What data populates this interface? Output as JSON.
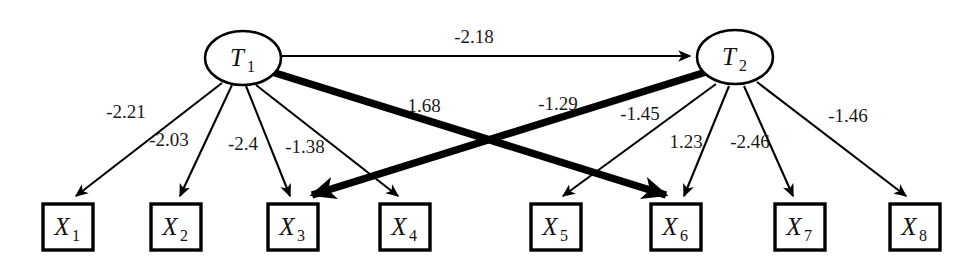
{
  "diagram": {
    "type": "path-diagram",
    "title": "",
    "latent_nodes": [
      {
        "id": "T1",
        "label": "T",
        "subscript": "1",
        "cx": 243,
        "cy": 58,
        "rx": 38,
        "ry": 27
      },
      {
        "id": "T2",
        "label": "T",
        "subscript": "2",
        "cx": 735,
        "cy": 57,
        "rx": 38,
        "ry": 27
      }
    ],
    "observed_nodes": [
      {
        "id": "X1",
        "label": "X",
        "subscript": "1",
        "x": 43,
        "y": 204,
        "w": 50,
        "h": 46
      },
      {
        "id": "X2",
        "label": "X",
        "subscript": "2",
        "x": 151,
        "y": 204,
        "w": 50,
        "h": 46
      },
      {
        "id": "X3",
        "label": "X",
        "subscript": "3",
        "x": 268,
        "y": 204,
        "w": 50,
        "h": 46
      },
      {
        "id": "X4",
        "label": "X",
        "subscript": "4",
        "x": 380,
        "y": 204,
        "w": 50,
        "h": 46
      },
      {
        "id": "X5",
        "label": "X",
        "subscript": "5",
        "x": 531,
        "y": 204,
        "w": 50,
        "h": 46
      },
      {
        "id": "X6",
        "label": "X",
        "subscript": "6",
        "x": 651,
        "y": 204,
        "w": 50,
        "h": 46
      },
      {
        "id": "X7",
        "label": "X",
        "subscript": "7",
        "x": 775,
        "y": 204,
        "w": 50,
        "h": 46
      },
      {
        "id": "X8",
        "label": "X",
        "subscript": "8",
        "x": 890,
        "y": 204,
        "w": 50,
        "h": 46
      }
    ],
    "edges": [
      {
        "id": "e-t1-t2",
        "from": "T1",
        "to": "T2",
        "weight": "-2.18",
        "weight_value": -2.18,
        "style": "thin",
        "label_x": 474,
        "label_y": 43,
        "x1": 282,
        "y1": 56,
        "x2": 690,
        "y2": 56
      },
      {
        "id": "e-t1-x1",
        "from": "T1",
        "to": "X1",
        "weight": "-2.21",
        "weight_value": -2.21,
        "style": "thin",
        "label_x": 126,
        "label_y": 118,
        "x1": 222,
        "y1": 83,
        "x2": 76,
        "y2": 196
      },
      {
        "id": "e-t1-x2",
        "from": "T1",
        "to": "X2",
        "weight": "-2.03",
        "weight_value": -2.03,
        "style": "thin",
        "label_x": 169,
        "label_y": 146,
        "x1": 232,
        "y1": 85,
        "x2": 180,
        "y2": 196
      },
      {
        "id": "e-t1-x3",
        "from": "T1",
        "to": "X3",
        "weight": "-2.4",
        "weight_value": -2.4,
        "style": "thin",
        "label_x": 243,
        "label_y": 150,
        "x1": 246,
        "y1": 86,
        "x2": 290,
        "y2": 196
      },
      {
        "id": "e-t1-x4",
        "from": "T1",
        "to": "X4",
        "weight": "-1.38",
        "weight_value": -1.38,
        "style": "thin",
        "label_x": 305,
        "label_y": 153,
        "x1": 256,
        "y1": 85,
        "x2": 398,
        "y2": 196
      },
      {
        "id": "e-t1-x6",
        "from": "T1",
        "to": "X6",
        "weight": "1.68",
        "weight_value": 1.68,
        "style": "thick",
        "label_x": 424,
        "label_y": 112,
        "x1": 272,
        "y1": 72,
        "x2": 666,
        "y2": 195
      },
      {
        "id": "e-t2-x3",
        "from": "T2",
        "to": "X3",
        "weight": "-1.29",
        "weight_value": -1.29,
        "style": "thick",
        "label_x": 558,
        "label_y": 110,
        "x1": 706,
        "y1": 72,
        "x2": 312,
        "y2": 195
      },
      {
        "id": "e-t2-x5",
        "from": "T2",
        "to": "X5",
        "weight": "-1.45",
        "weight_value": -1.45,
        "style": "thin",
        "label_x": 640,
        "label_y": 120,
        "x1": 716,
        "y1": 84,
        "x2": 563,
        "y2": 196
      },
      {
        "id": "e-t2-x6",
        "from": "T2",
        "to": "X6",
        "weight": "1.23",
        "weight_value": 1.23,
        "style": "thin",
        "label_x": 686,
        "label_y": 148,
        "x1": 729,
        "y1": 86,
        "x2": 684,
        "y2": 196
      },
      {
        "id": "e-t2-x7",
        "from": "T2",
        "to": "X7",
        "weight": "-2.46",
        "weight_value": -2.46,
        "style": "thin",
        "label_x": 750,
        "label_y": 148,
        "x1": 744,
        "y1": 86,
        "x2": 793,
        "y2": 196
      },
      {
        "id": "e-t2-x8",
        "from": "T2",
        "to": "X8",
        "weight": "-1.46",
        "weight_value": -1.46,
        "style": "thin",
        "label_x": 848,
        "label_y": 122,
        "x1": 757,
        "y1": 82,
        "x2": 906,
        "y2": 196
      }
    ]
  }
}
